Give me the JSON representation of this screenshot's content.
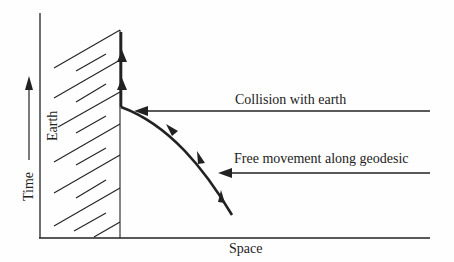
{
  "diagram": {
    "axes": {
      "x_label": "Space",
      "y_label": "Time"
    },
    "region_label": "Earth",
    "annotations": [
      {
        "id": "collision",
        "text": "Collision with earth"
      },
      {
        "id": "free",
        "text": "Free movement along geodesic"
      }
    ],
    "colors": {
      "line": "#222222",
      "background": "#fefefe"
    }
  }
}
